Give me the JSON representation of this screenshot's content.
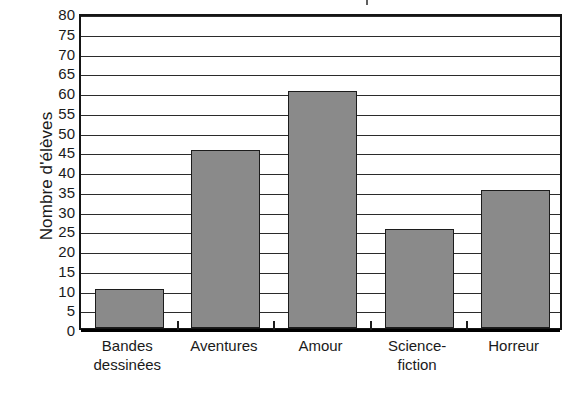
{
  "chart_data": {
    "type": "bar",
    "title": "",
    "xlabel": "",
    "ylabel": "Nombre d'élèves",
    "categories": [
      "Bandes dessinées",
      "Aventures",
      "Amour",
      "Science-fiction",
      "Horreur"
    ],
    "category_lines": [
      [
        "Bandes",
        "dessinées"
      ],
      [
        "Aventures",
        ""
      ],
      [
        "Amour",
        ""
      ],
      [
        "Science-",
        "fiction"
      ],
      [
        "Horreur",
        ""
      ]
    ],
    "values": [
      10,
      45,
      60,
      25,
      35
    ],
    "ylim": [
      0,
      80
    ],
    "ytick_step": 5,
    "yticks": [
      0,
      5,
      10,
      15,
      20,
      25,
      30,
      35,
      40,
      45,
      50,
      55,
      60,
      65,
      70,
      75,
      80
    ],
    "ytick_labels": [
      "0",
      "5",
      "10",
      "15",
      "20",
      "25",
      "30",
      "35",
      "40",
      "45",
      "50",
      "55",
      "60",
      "65",
      "70",
      "75",
      "80"
    ],
    "grid": true,
    "legend": false,
    "legend_position": "none",
    "bar_color": "#8a8a8a",
    "bar_outline_color": "#1c1c1c",
    "axis_color": "#151515",
    "background_color": "#ffffff"
  }
}
